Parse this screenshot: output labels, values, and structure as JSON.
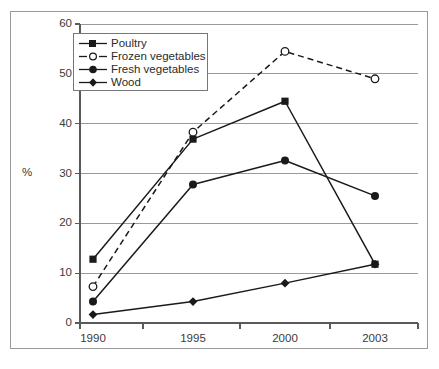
{
  "chart_data": {
    "type": "line",
    "title": "",
    "subtitle": "",
    "xlabel": "",
    "ylabel": "%",
    "categories": [
      "1990",
      "1995",
      "2000",
      "2003"
    ],
    "ylim": [
      0,
      60
    ],
    "ytick_values": [
      0,
      10,
      20,
      30,
      40,
      50,
      60
    ],
    "ytick_labels": [
      "0",
      "10",
      "20",
      "30",
      "40",
      "50",
      "60"
    ],
    "grid": true,
    "grid_axis": "y",
    "legend_position": "upper-left-inside",
    "series": [
      {
        "name": "Poultry",
        "values": [
          12.8,
          36.9,
          44.5,
          11.8
        ],
        "marker": "filled-square",
        "linestyle": "solid",
        "color": "#1a1a1a"
      },
      {
        "name": "Frozen vegetables",
        "values": [
          7.3,
          38.3,
          54.5,
          49.0
        ],
        "marker": "open-circle",
        "linestyle": "dashed",
        "color": "#1a1a1a"
      },
      {
        "name": "Fresh vegetables",
        "values": [
          4.3,
          27.8,
          32.6,
          25.5
        ],
        "marker": "filled-circle",
        "linestyle": "solid",
        "color": "#1a1a1a"
      },
      {
        "name": "Wood",
        "values": [
          1.7,
          4.3,
          8.0,
          11.8
        ],
        "marker": "filled-diamond",
        "linestyle": "solid",
        "color": "#1a1a1a"
      }
    ]
  },
  "axes": {
    "y_label": "%",
    "y_ticks": [
      "0",
      "10",
      "20",
      "30",
      "40",
      "50",
      "60"
    ],
    "x_ticks": [
      "1990",
      "1995",
      "2000",
      "2003"
    ]
  },
  "legend": {
    "entries": [
      {
        "label": "Poultry"
      },
      {
        "label": "Frozen vegetables"
      },
      {
        "label": "Fresh vegetables"
      },
      {
        "label": "Wood"
      }
    ]
  },
  "colors": {
    "gridline": "#9a9a9a",
    "axis": "#5a5a5a",
    "series": "#1a1a1a",
    "frame": "#9a9a9a",
    "background": "#ffffff",
    "text": "#3a3a3a"
  }
}
